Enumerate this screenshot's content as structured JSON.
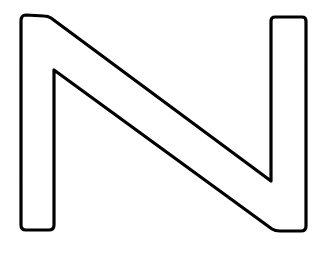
{
  "figure": {
    "glyph": "N",
    "style": "outline",
    "stroke_color": "#000000",
    "fill_color": "#ffffff",
    "background": "#ffffff"
  }
}
